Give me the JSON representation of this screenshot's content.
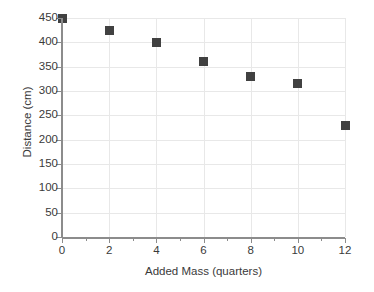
{
  "chart_data": {
    "type": "scatter",
    "title": "",
    "xlabel": "Added Mass (quarters)",
    "ylabel": "Distance (cm)",
    "x": [
      0,
      2,
      4,
      6,
      8,
      10,
      12
    ],
    "values": [
      450,
      425,
      400,
      360,
      330,
      315,
      230
    ],
    "series": [
      {
        "name": "Distance",
        "values": [
          450,
          425,
          400,
          360,
          330,
          315,
          230
        ]
      }
    ],
    "xlim": [
      0,
      12
    ],
    "ylim": [
      0,
      450
    ],
    "x_ticks": [
      "0",
      "2",
      "4",
      "6",
      "8",
      "10",
      "12"
    ],
    "y_ticks": [
      "0",
      "50",
      "100",
      "150",
      "200",
      "250",
      "300",
      "350",
      "400",
      "450"
    ],
    "x_tick_values": [
      0,
      2,
      4,
      6,
      8,
      10,
      12
    ],
    "y_tick_values": [
      0,
      50,
      100,
      150,
      200,
      250,
      300,
      350,
      400,
      450
    ],
    "x_minor_tick_values": [
      1,
      3,
      5,
      7,
      9,
      11
    ],
    "grid": true,
    "grid_axis": "both",
    "legend": false,
    "marker": "square",
    "marker_color": "#414141",
    "grid_color": "#e8e8e8",
    "axis_color": "#8c8c8c",
    "text_color": "#3a3a3a",
    "background_color": "#ffffff"
  },
  "title_remnant": ""
}
